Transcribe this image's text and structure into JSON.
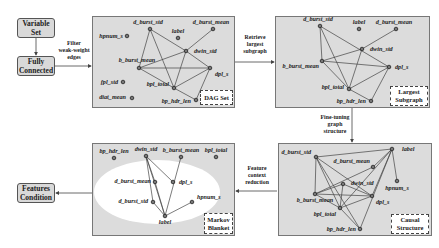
{
  "boxes": {
    "variable_set": "Variable Set",
    "fully_connected": "Fully Connected",
    "features_condition": "Features Condition"
  },
  "steps": {
    "filter": [
      "Filter",
      "weak-weight",
      "edges"
    ],
    "retrieve": [
      "Retrieve",
      "largest",
      "subgraph"
    ],
    "finetune": [
      "Fine-tuning",
      "graph",
      "structure"
    ],
    "reduction": [
      "Feature",
      "context",
      "reduction"
    ]
  },
  "panels": {
    "dag_set": {
      "tag": "DAG Set",
      "nodes": [
        {
          "id": "d_burst_std",
          "label": "d_burst_std"
        },
        {
          "id": "d_burst_mean",
          "label": "d_burst_mean"
        },
        {
          "id": "hpnum_s",
          "label": "hpnum_s"
        },
        {
          "id": "label",
          "label": "label"
        },
        {
          "id": "dwin_std",
          "label": "dwin_std"
        },
        {
          "id": "b_burst_mean",
          "label": "b_burst_mean"
        },
        {
          "id": "dpl_s",
          "label": "dpl_s"
        },
        {
          "id": "fpl_std",
          "label": "fpl_std"
        },
        {
          "id": "bpl_total",
          "label": "bpl_total"
        },
        {
          "id": "diat_mean",
          "label": "diat_mean"
        },
        {
          "id": "bp_hdr_len",
          "label": "bp_hdr_len"
        }
      ],
      "edges": [
        [
          "d_burst_std",
          "b_burst_mean"
        ],
        [
          "d_burst_std",
          "dwin_std"
        ],
        [
          "d_burst_std",
          "bpl_total"
        ],
        [
          "d_burst_mean",
          "dwin_std"
        ],
        [
          "dwin_std",
          "b_burst_mean"
        ],
        [
          "dwin_std",
          "bpl_total"
        ],
        [
          "dwin_std",
          "dpl_s"
        ],
        [
          "b_burst_mean",
          "dpl_s"
        ],
        [
          "b_burst_mean",
          "bpl_total"
        ],
        [
          "dpl_s",
          "bpl_total"
        ],
        [
          "dpl_s",
          "bp_hdr_len"
        ],
        [
          "bpl_total",
          "bp_hdr_len"
        ]
      ]
    },
    "largest_subgraph": {
      "tag": [
        "Largest",
        "Subgraph"
      ],
      "nodes": [
        {
          "id": "d_burst_std",
          "label": "d_burst_std"
        },
        {
          "id": "label",
          "label": "label"
        },
        {
          "id": "d_burst_mean",
          "label": "d_burst_mean"
        },
        {
          "id": "dwin_std",
          "label": "dwin_std"
        },
        {
          "id": "b_burst_mean",
          "label": "b_burst_mean"
        },
        {
          "id": "dpl_s",
          "label": "dpl_s"
        },
        {
          "id": "bpl_total",
          "label": "bpl_total"
        },
        {
          "id": "bp_hdr_len",
          "label": "bp_hdr_len"
        }
      ],
      "edges": [
        [
          "d_burst_std",
          "b_burst_mean"
        ],
        [
          "d_burst_std",
          "dpl_s"
        ],
        [
          "d_burst_std",
          "bpl_total"
        ],
        [
          "d_burst_mean",
          "dwin_std"
        ],
        [
          "dwin_std",
          "b_burst_mean"
        ],
        [
          "dwin_std",
          "bpl_total"
        ],
        [
          "b_burst_mean",
          "dpl_s"
        ],
        [
          "b_burst_mean",
          "bpl_total"
        ],
        [
          "dpl_s",
          "bpl_total"
        ],
        [
          "dpl_s",
          "bp_hdr_len"
        ],
        [
          "bpl_total",
          "bp_hdr_len"
        ]
      ]
    },
    "causal_structure": {
      "tag": [
        "Causal",
        "Structure"
      ],
      "nodes": [
        {
          "id": "d_burst_std",
          "label": "d_burst_std"
        },
        {
          "id": "label",
          "label": "label"
        },
        {
          "id": "d_burst_mean",
          "label": "d_burst_mean"
        },
        {
          "id": "dwin_std",
          "label": "dwin_std"
        },
        {
          "id": "hpnum_s",
          "label": "hpnum_s"
        },
        {
          "id": "b_burst_mean",
          "label": "b_burst_mean"
        },
        {
          "id": "dpl_s",
          "label": "dpl_s"
        },
        {
          "id": "bpl_total",
          "label": "bpl_total"
        },
        {
          "id": "bp_hdr_len",
          "label": "bp_hdr_len"
        }
      ],
      "edges": [
        [
          "d_burst_std",
          "label"
        ],
        [
          "d_burst_std",
          "b_burst_mean"
        ],
        [
          "d_burst_std",
          "dpl_s"
        ],
        [
          "d_burst_std",
          "bpl_total"
        ],
        [
          "d_burst_std",
          "bp_hdr_len"
        ],
        [
          "label",
          "d_burst_mean"
        ],
        [
          "label",
          "dpl_s"
        ],
        [
          "label",
          "bp_hdr_len"
        ],
        [
          "label",
          "hpnum_s"
        ],
        [
          "label",
          "bpl_total"
        ],
        [
          "d_burst_mean",
          "b_burst_mean"
        ],
        [
          "dwin_std",
          "bpl_total"
        ],
        [
          "dwin_std",
          "b_burst_mean"
        ],
        [
          "dwin_std",
          "dpl_s"
        ],
        [
          "b_burst_mean",
          "dpl_s"
        ],
        [
          "b_burst_mean",
          "bpl_total"
        ],
        [
          "dpl_s",
          "bpl_total"
        ],
        [
          "bpl_total",
          "bp_hdr_len"
        ]
      ]
    },
    "markov_blanket": {
      "tag": [
        "Markov",
        "Blanket"
      ],
      "nodes": [
        {
          "id": "bp_hdr_len",
          "label": "bp_hdr_len"
        },
        {
          "id": "dwin_std",
          "label": "dwin_std"
        },
        {
          "id": "b_burst_mean",
          "label": "b_burst_mean"
        },
        {
          "id": "bpl_total",
          "label": "bpl_total"
        },
        {
          "id": "d_burst_mean",
          "label": "d_burst_mean"
        },
        {
          "id": "dpl_s",
          "label": "dpl_s"
        },
        {
          "id": "d_burst_std",
          "label": "d_burst_std"
        },
        {
          "id": "hpnum_s",
          "label": "hpnum_s"
        },
        {
          "id": "label",
          "label": "label"
        }
      ],
      "edges": [
        [
          "dwin_std",
          "d_burst_mean"
        ],
        [
          "dwin_std",
          "dpl_s"
        ],
        [
          "dwin_std",
          "label"
        ],
        [
          "dwin_std",
          "d_burst_std"
        ],
        [
          "b_burst_mean",
          "label"
        ],
        [
          "d_burst_mean",
          "label"
        ],
        [
          "d_burst_std",
          "label"
        ],
        [
          "hpnum_s",
          "label"
        ]
      ]
    }
  }
}
